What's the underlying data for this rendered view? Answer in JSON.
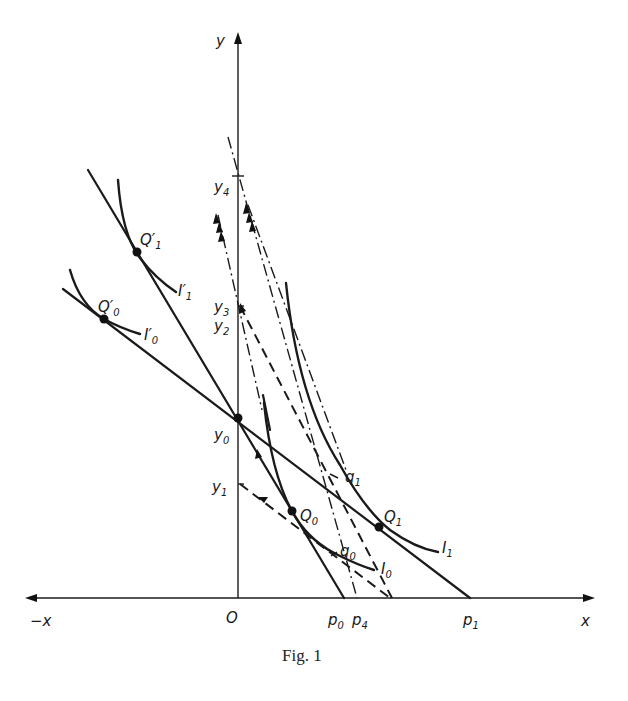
{
  "figure": {
    "caption": "Fig. 1",
    "axes": {
      "x_label": "x",
      "neg_x_label": "−x",
      "y_label": "y",
      "origin_label": "O"
    },
    "y_axis_points": {
      "y0": {
        "base": "y",
        "sub": "0"
      },
      "y1": {
        "base": "y",
        "sub": "1"
      },
      "y2": {
        "base": "y",
        "sub": "2"
      },
      "y3": {
        "base": "y",
        "sub": "3"
      },
      "y4": {
        "base": "y",
        "sub": "4"
      }
    },
    "x_axis_points": {
      "p0": {
        "base": "p",
        "sub": "0"
      },
      "p4": {
        "base": "p",
        "sub": "4"
      },
      "p1": {
        "base": "p",
        "sub": "1"
      }
    },
    "tangency_points": {
      "Q0": {
        "base": "Q",
        "sub": "0"
      },
      "Q1": {
        "base": "Q",
        "sub": "1"
      },
      "Q0_prime": {
        "base": "Q′",
        "sub": "0"
      },
      "Q1_prime": {
        "base": "Q′",
        "sub": "1"
      },
      "q0": {
        "base": "q",
        "sub": "0"
      },
      "q1": {
        "base": "q",
        "sub": "1"
      }
    },
    "indifference_curves": {
      "I0": {
        "base": "I",
        "sub": "0"
      },
      "I1": {
        "base": "I",
        "sub": "1"
      },
      "I0_prime": {
        "base": "I′",
        "sub": "0"
      },
      "I1_prime": {
        "base": "I′",
        "sub": "1"
      }
    }
  }
}
